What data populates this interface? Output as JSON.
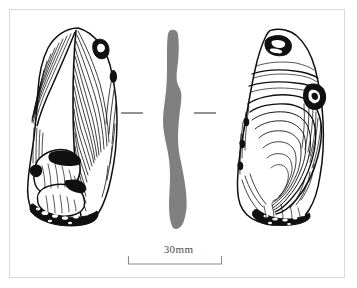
{
  "figure": {
    "kind": "archaeological-artifact-illustration",
    "frame": {
      "border_color": "#d8d8d8",
      "background": "#ffffff"
    },
    "ink_color": "#101010",
    "section_fill_color": "#808080"
  },
  "views": [
    {
      "id": "dorsal",
      "label": "dorsal view",
      "position": "left",
      "description": "dorsal face with converging flake-scar ridges and retouched basal edge"
    },
    {
      "id": "section",
      "label": "profile section",
      "position": "centre",
      "description": "solid grey longitudinal section silhouette flanked by section tick marks"
    },
    {
      "id": "ventral",
      "label": "ventral view",
      "position": "right",
      "description": "ventral face with concentric conchoidal ripples and bulb of percussion"
    }
  ],
  "section_marks": {
    "label": "section-indicator-tick",
    "count": 2,
    "y": 113,
    "left": {
      "x1": 121,
      "x2": 143
    },
    "right": {
      "x1": 194,
      "x2": 216
    }
  },
  "scale_bar": {
    "label": "30mm",
    "value": 30,
    "unit": "mm",
    "x_start": 128,
    "x_end": 222,
    "y": 264,
    "tick_height": 8,
    "color": "#8a8a8a"
  }
}
